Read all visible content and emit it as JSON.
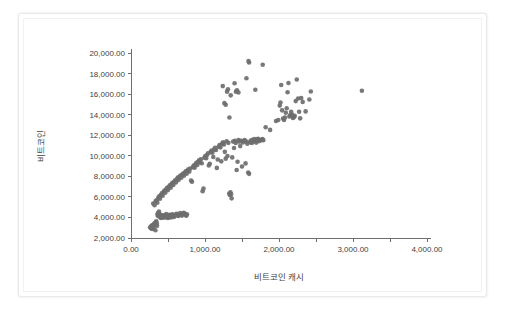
{
  "chart_data": {
    "type": "scatter",
    "title": "",
    "xlabel": "비트코인 캐시",
    "ylabel": "비트코인",
    "xlim": [
      0,
      4000
    ],
    "ylim": [
      2000,
      20000
    ],
    "xticks": [
      0,
      1000,
      2000,
      3000,
      4000
    ],
    "xtick_labels": [
      "0.00",
      "1,000.00",
      "2,000.00",
      "3,000.00",
      "4,000.00"
    ],
    "xminor_ticks": [
      500,
      1500,
      2500,
      3500
    ],
    "yticks": [
      2000,
      4000,
      6000,
      8000,
      10000,
      12000,
      14000,
      16000,
      18000,
      20000
    ],
    "ytick_labels": [
      "2,000.00",
      "4,000.00",
      "6,000.00",
      "8,000.00",
      "10,000.00",
      "12,000.00",
      "14,000.00",
      "16,000.00",
      "18,000.00",
      "20,000.00"
    ],
    "grid": false,
    "legend": false,
    "legend_position": "none",
    "marker": {
      "shape": "circle",
      "color": "#6e6e6e",
      "size_px": 4.6,
      "opacity": 0.92
    },
    "series": [
      {
        "name": "비트코인 vs 비트코인 캐시",
        "color": "#6e6e6e",
        "points": [
          [
            258,
            3050
          ],
          [
            268,
            2950
          ],
          [
            276,
            3180
          ],
          [
            285,
            2880
          ],
          [
            292,
            3250
          ],
          [
            300,
            3120
          ],
          [
            305,
            2980
          ],
          [
            312,
            3380
          ],
          [
            318,
            3290
          ],
          [
            324,
            3460
          ],
          [
            330,
            2760
          ],
          [
            336,
            3540
          ],
          [
            342,
            3620
          ],
          [
            348,
            3400
          ],
          [
            352,
            3180
          ],
          [
            358,
            4250
          ],
          [
            362,
            4380
          ],
          [
            368,
            4120
          ],
          [
            372,
            4460
          ],
          [
            378,
            4580
          ],
          [
            384,
            4300
          ],
          [
            390,
            4180
          ],
          [
            396,
            4020
          ],
          [
            402,
            3960
          ],
          [
            408,
            4100
          ],
          [
            414,
            4240
          ],
          [
            420,
            4060
          ],
          [
            428,
            3980
          ],
          [
            436,
            4140
          ],
          [
            444,
            4220
          ],
          [
            452,
            4050
          ],
          [
            460,
            3990
          ],
          [
            468,
            4180
          ],
          [
            476,
            4320
          ],
          [
            484,
            4100
          ],
          [
            492,
            4010
          ],
          [
            500,
            3950
          ],
          [
            508,
            4120
          ],
          [
            516,
            4260
          ],
          [
            524,
            4180
          ],
          [
            532,
            4080
          ],
          [
            540,
            4000
          ],
          [
            548,
            4160
          ],
          [
            556,
            4310
          ],
          [
            564,
            4230
          ],
          [
            572,
            4120
          ],
          [
            580,
            4050
          ],
          [
            592,
            4180
          ],
          [
            604,
            4290
          ],
          [
            616,
            4360
          ],
          [
            628,
            4200
          ],
          [
            640,
            4150
          ],
          [
            652,
            4280
          ],
          [
            664,
            4420
          ],
          [
            676,
            4260
          ],
          [
            688,
            4180
          ],
          [
            700,
            4310
          ],
          [
            712,
            4460
          ],
          [
            724,
            4380
          ],
          [
            736,
            4240
          ],
          [
            748,
            4160
          ],
          [
            756,
            4300
          ],
          [
            300,
            5350
          ],
          [
            318,
            5180
          ],
          [
            332,
            5560
          ],
          [
            344,
            5680
          ],
          [
            356,
            5440
          ],
          [
            368,
            5880
          ],
          [
            380,
            6060
          ],
          [
            392,
            5820
          ],
          [
            404,
            6180
          ],
          [
            416,
            6340
          ],
          [
            428,
            6120
          ],
          [
            440,
            6460
          ],
          [
            452,
            6620
          ],
          [
            464,
            6400
          ],
          [
            476,
            6740
          ],
          [
            488,
            6880
          ],
          [
            500,
            6660
          ],
          [
            512,
            6980
          ],
          [
            524,
            7120
          ],
          [
            536,
            6900
          ],
          [
            548,
            7240
          ],
          [
            560,
            7380
          ],
          [
            572,
            7160
          ],
          [
            584,
            7480
          ],
          [
            596,
            7620
          ],
          [
            608,
            7400
          ],
          [
            620,
            7720
          ],
          [
            632,
            7880
          ],
          [
            644,
            7660
          ],
          [
            656,
            7960
          ],
          [
            668,
            8080
          ],
          [
            680,
            7860
          ],
          [
            692,
            8160
          ],
          [
            704,
            8280
          ],
          [
            716,
            8060
          ],
          [
            728,
            8360
          ],
          [
            740,
            8480
          ],
          [
            752,
            8260
          ],
          [
            764,
            8560
          ],
          [
            776,
            8680
          ],
          [
            788,
            8460
          ],
          [
            800,
            8760
          ],
          [
            812,
            7600
          ],
          [
            824,
            7480
          ],
          [
            836,
            8880
          ],
          [
            848,
            9060
          ],
          [
            860,
            8840
          ],
          [
            872,
            9180
          ],
          [
            884,
            9320
          ],
          [
            896,
            9100
          ],
          [
            908,
            9420
          ],
          [
            920,
            9560
          ],
          [
            932,
            9340
          ],
          [
            944,
            9660
          ],
          [
            956,
            9280
          ],
          [
            968,
            6560
          ],
          [
            980,
            6820
          ],
          [
            992,
            9820
          ],
          [
            1004,
            9980
          ],
          [
            1016,
            9760
          ],
          [
            1028,
            10080
          ],
          [
            1040,
            10240
          ],
          [
            1052,
            9060
          ],
          [
            1064,
            9220
          ],
          [
            1076,
            10360
          ],
          [
            1088,
            10520
          ],
          [
            1100,
            10300
          ],
          [
            1112,
            9880
          ],
          [
            1124,
            10620
          ],
          [
            1136,
            10780
          ],
          [
            1148,
            10560
          ],
          [
            1160,
            8820
          ],
          [
            1172,
            9640
          ],
          [
            1184,
            10880
          ],
          [
            1196,
            11040
          ],
          [
            1208,
            10820
          ],
          [
            1220,
            9460
          ],
          [
            1232,
            11180
          ],
          [
            1244,
            11320
          ],
          [
            1256,
            11100
          ],
          [
            1268,
            10380
          ],
          [
            1280,
            9720
          ],
          [
            1292,
            11420
          ],
          [
            1304,
            9980
          ],
          [
            1316,
            11260
          ],
          [
            1328,
            6320
          ],
          [
            1336,
            6180
          ],
          [
            1344,
            6440
          ],
          [
            1352,
            6260
          ],
          [
            1360,
            5860
          ],
          [
            1368,
            9840
          ],
          [
            1380,
            11380
          ],
          [
            1392,
            10760
          ],
          [
            1404,
            11460
          ],
          [
            1416,
            11240
          ],
          [
            1428,
            8620
          ],
          [
            1440,
            9420
          ],
          [
            1452,
            11520
          ],
          [
            1464,
            11380
          ],
          [
            1476,
            10940
          ],
          [
            1488,
            11460
          ],
          [
            1500,
            8960
          ],
          [
            1512,
            11300
          ],
          [
            1524,
            11420
          ],
          [
            1536,
            11540
          ],
          [
            1548,
            9260
          ],
          [
            1560,
            11380
          ],
          [
            1572,
            11180
          ],
          [
            1584,
            8380
          ],
          [
            1596,
            8240
          ],
          [
            1608,
            11320
          ],
          [
            1620,
            11480
          ],
          [
            1632,
            11240
          ],
          [
            1644,
            11560
          ],
          [
            1656,
            11380
          ],
          [
            1668,
            11620
          ],
          [
            1680,
            11460
          ],
          [
            1692,
            11280
          ],
          [
            1704,
            11580
          ],
          [
            1716,
            11640
          ],
          [
            1728,
            11420
          ],
          [
            1740,
            11540
          ],
          [
            1752,
            11480
          ],
          [
            1764,
            11560
          ],
          [
            1776,
            11620
          ],
          [
            1788,
            11520
          ],
          [
            1240,
            16780
          ],
          [
            1262,
            15120
          ],
          [
            1280,
            14960
          ],
          [
            1298,
            16240
          ],
          [
            1310,
            16480
          ],
          [
            1330,
            13720
          ],
          [
            1348,
            15880
          ],
          [
            1400,
            17060
          ],
          [
            1418,
            16240
          ],
          [
            1432,
            16380
          ],
          [
            1452,
            16160
          ],
          [
            1560,
            17540
          ],
          [
            1588,
            19220
          ],
          [
            1596,
            19080
          ],
          [
            1680,
            16420
          ],
          [
            1780,
            18860
          ],
          [
            1820,
            12780
          ],
          [
            1880,
            12520
          ],
          [
            1960,
            13380
          ],
          [
            1990,
            13480
          ],
          [
            2010,
            14880
          ],
          [
            2020,
            15180
          ],
          [
            2030,
            16880
          ],
          [
            2042,
            14420
          ],
          [
            2055,
            13620
          ],
          [
            2068,
            13480
          ],
          [
            2080,
            13720
          ],
          [
            2092,
            14180
          ],
          [
            2104,
            14620
          ],
          [
            2116,
            16180
          ],
          [
            2128,
            17080
          ],
          [
            2140,
            13820
          ],
          [
            2152,
            13960
          ],
          [
            2164,
            14280
          ],
          [
            2176,
            14020
          ],
          [
            2188,
            13680
          ],
          [
            2200,
            13760
          ],
          [
            2212,
            13880
          ],
          [
            2226,
            15320
          ],
          [
            2240,
            17420
          ],
          [
            2258,
            15580
          ],
          [
            2272,
            14280
          ],
          [
            2286,
            13640
          ],
          [
            2300,
            15620
          ],
          [
            2320,
            15240
          ],
          [
            2360,
            14320
          ],
          [
            2410,
            15480
          ],
          [
            2430,
            16260
          ],
          [
            3120,
            16320
          ]
        ]
      }
    ]
  }
}
